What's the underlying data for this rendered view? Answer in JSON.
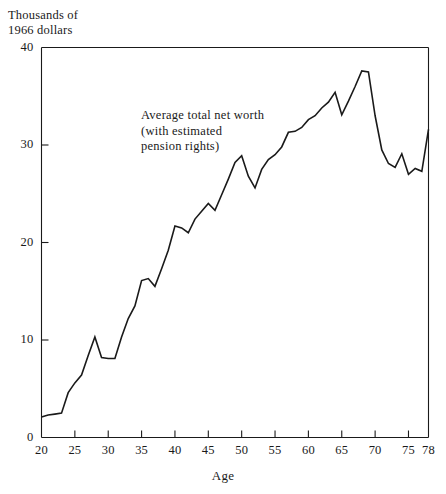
{
  "chart_data": {
    "type": "line",
    "title": "",
    "ylabel": "Thousands of\n1966 dollars",
    "xlabel": "Age",
    "xlim": [
      20,
      78
    ],
    "ylim": [
      0,
      40
    ],
    "grid": false,
    "legend": "none",
    "annotations": [
      {
        "text": "Average total net worth\n(with estimated\npension rights)",
        "x": 40,
        "y": 32
      }
    ],
    "yticks": [
      0,
      10,
      20,
      30,
      40
    ],
    "ytick_labels": [
      "0",
      "10",
      "20",
      "30",
      "40"
    ],
    "xticks": [
      20,
      25,
      30,
      35,
      40,
      45,
      50,
      55,
      60,
      65,
      70,
      75,
      78
    ],
    "xtick_labels": [
      "20",
      "25",
      "30",
      "35",
      "40",
      "45",
      "50",
      "55",
      "60",
      "65",
      "70",
      "75",
      "78"
    ],
    "series": [
      {
        "name": "Average total net worth (with estimated pension rights)",
        "color": "#1a1a1a",
        "x": [
          20,
          21,
          22,
          23,
          24,
          25,
          26,
          27,
          28,
          29,
          30,
          31,
          32,
          33,
          34,
          35,
          36,
          37,
          38,
          39,
          40,
          41,
          42,
          43,
          44,
          45,
          46,
          47,
          48,
          49,
          50,
          51,
          52,
          53,
          54,
          55,
          56,
          57,
          58,
          59,
          60,
          61,
          62,
          63,
          64,
          65,
          66,
          67,
          68,
          69,
          70,
          71,
          72,
          73,
          74,
          75,
          76,
          77,
          78
        ],
        "values": [
          2.1,
          2.3,
          2.4,
          2.5,
          4.6,
          5.6,
          6.4,
          8.4,
          10.3,
          8.2,
          8.1,
          8.1,
          10.3,
          12.2,
          13.5,
          16.1,
          16.3,
          15.5,
          17.3,
          19.2,
          21.7,
          21.5,
          21.0,
          22.4,
          23.2,
          24.0,
          23.3,
          24.9,
          26.5,
          28.2,
          28.9,
          26.8,
          25.6,
          27.5,
          28.5,
          29.0,
          29.8,
          31.3,
          31.4,
          31.8,
          32.6,
          33.0,
          33.8,
          34.4,
          35.4,
          33.1,
          34.5,
          36.0,
          37.6,
          37.5,
          33.0,
          29.5,
          28.1,
          27.7,
          29.1,
          27.0,
          27.6,
          27.3,
          31.6
        ]
      }
    ]
  },
  "axis_title": {
    "line1": "Thousands of",
    "line2": "1966 dollars"
  },
  "annotation_text": {
    "line1": "Average total net worth",
    "line2": "(with estimated",
    "line3": "pension rights)"
  },
  "axis_name_x": "Age"
}
